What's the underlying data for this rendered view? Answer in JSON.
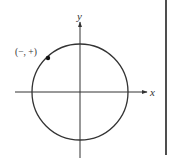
{
  "figure": {
    "type": "unit-circle-quadrant-diagram",
    "axes": {
      "x_label": "x",
      "y_label": "y"
    },
    "circle": {
      "center": [
        0,
        0
      ]
    },
    "point": {
      "label": "(−, +)",
      "quadrant": "II"
    },
    "colors": {
      "stroke": "#333333",
      "background": "#ffffff",
      "border": "#222222"
    }
  }
}
